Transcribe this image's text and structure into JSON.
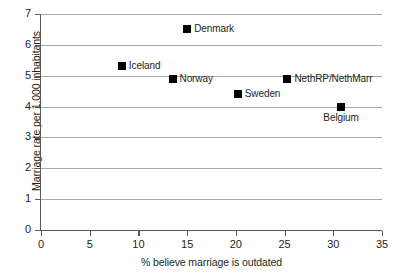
{
  "chart_data": {
    "type": "scatter",
    "title": "",
    "xlabel": "% believe marriage is outdated",
    "ylabel": "Marriage rate per 1,000 inhabitants",
    "xlim": [
      0,
      35
    ],
    "ylim": [
      0,
      7
    ],
    "xticks": [
      0,
      5,
      10,
      15,
      20,
      25,
      30,
      35
    ],
    "yticks": [
      0,
      1,
      2,
      3,
      4,
      5,
      6,
      7
    ],
    "xtick_labels": [
      "0",
      "5",
      "10",
      "15",
      "20",
      "25",
      "30",
      "35"
    ],
    "ytick_labels": [
      "0",
      "1",
      "2",
      "3",
      "4",
      "5",
      "6",
      "7"
    ],
    "grid": "horizontal",
    "legend": "none",
    "marker_color": "#000000",
    "gridline_color": "#a7a9ac",
    "axis_color": "#58595b",
    "background_color": "#ffffff",
    "points": [
      {
        "label": "Denmark",
        "x": 15.0,
        "y": 6.5,
        "label_position": "right"
      },
      {
        "label": "Iceland",
        "x": 8.3,
        "y": 5.3,
        "label_position": "right"
      },
      {
        "label": "Norway",
        "x": 13.5,
        "y": 4.9,
        "label_position": "right"
      },
      {
        "label": "Sweden",
        "x": 20.2,
        "y": 4.4,
        "label_position": "right"
      },
      {
        "label": "NethRP/NethMarr",
        "x": 25.3,
        "y": 4.9,
        "label_position": "right"
      },
      {
        "label": "Belgium",
        "x": 30.8,
        "y": 4.0,
        "label_position": "below"
      }
    ]
  }
}
